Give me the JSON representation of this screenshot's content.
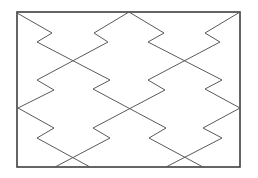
{
  "diagram": {
    "type": "zigzag-tessellation",
    "canvas": {
      "width": 258,
      "height": 178,
      "background": "#ffffff"
    },
    "frame": {
      "x": 17,
      "y": 12,
      "width": 223,
      "height": 155,
      "stroke": "#3f3f3f"
    },
    "line_color": "#5a5a5a",
    "paths": [
      {
        "id": "a1",
        "points": [
          [
            17,
            13
          ],
          [
            52,
            33
          ],
          [
            37,
            42
          ],
          [
            110,
            80
          ],
          [
            93,
            89
          ],
          [
            166,
            128
          ],
          [
            149,
            138
          ],
          [
            203,
            167
          ]
        ]
      },
      {
        "id": "a2",
        "points": [
          [
            129,
            12
          ],
          [
            94,
            33
          ],
          [
            108,
            42
          ],
          [
            37,
            80
          ],
          [
            54,
            90
          ],
          [
            18,
            108
          ]
        ]
      },
      {
        "id": "a3",
        "points": [
          [
            18,
            108
          ],
          [
            54,
            128
          ],
          [
            37,
            138
          ],
          [
            90,
            167
          ]
        ]
      },
      {
        "id": "b1",
        "points": [
          [
            129,
            12
          ],
          [
            164,
            33
          ],
          [
            148,
            42
          ],
          [
            222,
            80
          ],
          [
            205,
            89
          ],
          [
            240,
            108
          ]
        ]
      },
      {
        "id": "b2",
        "points": [
          [
            240,
            12
          ],
          [
            205,
            33
          ],
          [
            220,
            42
          ],
          [
            148,
            80
          ],
          [
            165,
            90
          ],
          [
            93,
            128
          ],
          [
            110,
            138
          ],
          [
            55,
            167
          ]
        ]
      },
      {
        "id": "b3",
        "points": [
          [
            240,
            108
          ],
          [
            203,
            128
          ],
          [
            222,
            138
          ],
          [
            166,
            167
          ]
        ]
      }
    ]
  }
}
